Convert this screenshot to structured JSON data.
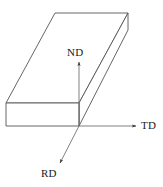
{
  "figure": {
    "background_color": "#ffffff",
    "line_color": "#555555",
    "label_color": "#1a1a1a",
    "width": 163,
    "height": 187
  },
  "axes": {
    "origin": {
      "x": 79,
      "y": 126
    },
    "items": [
      {
        "id": "nd",
        "label": "ND",
        "meaning": "normal-direction",
        "direction": "up",
        "tip": {
          "x": 79,
          "y": 62
        },
        "label_pos": {
          "x": 67,
          "y": 47
        }
      },
      {
        "id": "td",
        "label": "TD",
        "meaning": "transverse-direction",
        "direction": "right",
        "tip": {
          "x": 136,
          "y": 126
        },
        "label_pos": {
          "x": 141,
          "y": 120
        }
      },
      {
        "id": "rd",
        "label": "RD",
        "meaning": "rolling-direction",
        "direction": "down-left",
        "tip": {
          "x": 60,
          "y": 163
        },
        "label_pos": {
          "x": 41,
          "y": 168
        }
      }
    ]
  },
  "slab": {
    "name": "rolled-sheet-slab",
    "faces": {
      "top": "55,13 128,13 79,103 6,103",
      "front": "6,103 79,103 79,126 6,126",
      "right_side": "128,13 128,30 79,126 79,103"
    },
    "fill_color": "#ffffff",
    "stroke_color": "#555555",
    "stroke_width": 0.9
  }
}
